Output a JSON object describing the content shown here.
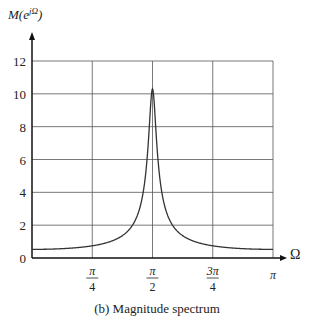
{
  "chart_data": {
    "type": "line",
    "title": "",
    "caption": "(b)  Magnitude spectrum",
    "xlabel": "Ω",
    "ylabel": "M(e^{jΩ})",
    "xlim": [
      0,
      3.14159
    ],
    "ylim": [
      0,
      12
    ],
    "grid": true,
    "x_ticks": [
      {
        "value": 0.7854,
        "label": "π/4",
        "num": "π",
        "den": "4"
      },
      {
        "value": 1.5708,
        "label": "π/2",
        "num": "π",
        "den": "2"
      },
      {
        "value": 2.3562,
        "label": "3π/4",
        "num": "3π",
        "den": "4"
      },
      {
        "value": 3.14159,
        "label": "π",
        "num": "π",
        "den": ""
      }
    ],
    "y_ticks": [
      0,
      2,
      4,
      6,
      8,
      10,
      12
    ],
    "series": [
      {
        "name": "M(e^{jΩ})",
        "color": "#333333",
        "model": "1/sqrt(1 + a^2 + 2a cos(2Ω)), a = 0.903",
        "x": [
          0,
          0.3927,
          0.7854,
          1.1781,
          1.3744,
          1.4726,
          1.5217,
          1.5708,
          1.6199,
          1.669,
          1.7671,
          1.9635,
          2.3562,
          2.7489,
          3.14159
        ],
        "values": [
          0.53,
          0.57,
          0.74,
          1.35,
          2.72,
          5.06,
          7.9,
          10.3,
          7.9,
          5.06,
          2.72,
          1.35,
          0.74,
          0.57,
          0.53
        ]
      }
    ],
    "peak": {
      "x": 1.5708,
      "y": 10.3
    }
  },
  "labels": {
    "y_axis": "M(e",
    "y_axis_sup": "jΩ",
    "y_axis_close": ")",
    "x_axis": "Ω",
    "caption": "(b)  Magnitude spectrum"
  }
}
